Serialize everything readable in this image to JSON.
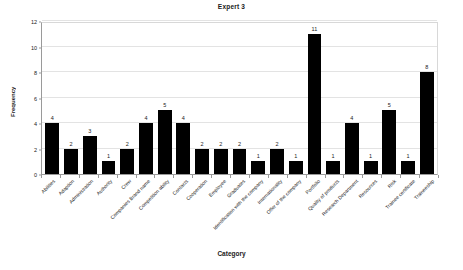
{
  "chart_data": {
    "type": "bar",
    "title": "Expert 3",
    "xlabel": "Category",
    "ylabel": "Frequency",
    "ylim": [
      0,
      12
    ],
    "yticks": [
      0,
      2,
      4,
      6,
      8,
      10,
      12
    ],
    "grid": true,
    "legend": "none",
    "bar_color": "#000000",
    "show_value_labels": true,
    "categories": [
      "Abilities",
      "Adaption",
      "Administration",
      "Authority",
      "Crew",
      "Companies Brand name",
      "Competition ability",
      "Contacts",
      "Cooperation",
      "Employee",
      "Graduates",
      "Identification with the company",
      "Internationality",
      "Offer of the company",
      "Portfolio",
      "Quality of products",
      "Research Department",
      "Resources",
      "Risk",
      "Trainee certificate",
      "Traineeship"
    ],
    "values": [
      4,
      2,
      3,
      1,
      2,
      4,
      5,
      4,
      2,
      2,
      2,
      1,
      2,
      1,
      11,
      1,
      4,
      1,
      5,
      1,
      8
    ]
  }
}
